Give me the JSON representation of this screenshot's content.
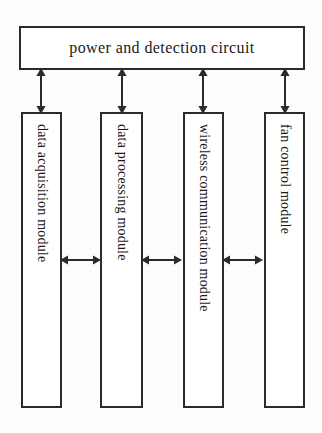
{
  "diagram": {
    "stroke_color": "#2b2b2b",
    "background_color": "#fdfdfd",
    "top_block": {
      "label": "power and detection circuit"
    },
    "modules": [
      {
        "id": "data-acquisition",
        "label": "data acquisition module"
      },
      {
        "id": "data-processing",
        "label": "data processing module"
      },
      {
        "id": "wireless-communication",
        "label": "wireless communication module"
      },
      {
        "id": "fan-control",
        "label": "fan control module"
      }
    ],
    "vertical_connectors": [
      {
        "from": "power and detection circuit",
        "to": "data acquisition module",
        "type": "double-arrow"
      },
      {
        "from": "power and detection circuit",
        "to": "data processing module",
        "type": "double-arrow"
      },
      {
        "from": "power and detection circuit",
        "to": "wireless communication module",
        "type": "double-arrow"
      },
      {
        "from": "power and detection circuit",
        "to": "fan control module",
        "type": "double-arrow"
      }
    ],
    "horizontal_connectors": [
      {
        "from": "data acquisition module",
        "to": "data processing module",
        "type": "double-arrow"
      },
      {
        "from": "data processing module",
        "to": "wireless communication module",
        "type": "double-arrow"
      },
      {
        "from": "wireless communication module",
        "to": "fan control module",
        "type": "double-arrow"
      }
    ]
  }
}
